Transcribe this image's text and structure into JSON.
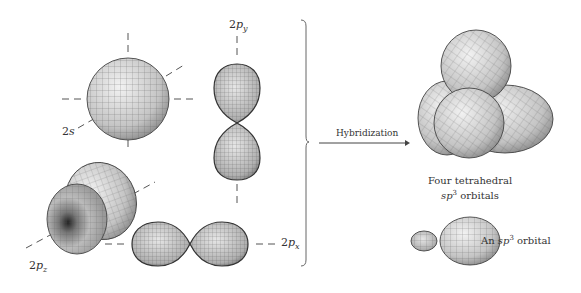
{
  "diagram": {
    "left_group": {
      "orbitals": [
        {
          "id": "2s",
          "label_main": "2",
          "label_italic": "s"
        },
        {
          "id": "2py",
          "label_main": "2",
          "label_italic": "p",
          "label_sub": "y"
        },
        {
          "id": "2pz",
          "label_main": "2",
          "label_italic": "p",
          "label_sub": "z"
        },
        {
          "id": "2px",
          "label_main": "2",
          "label_italic": "p",
          "label_sub": "x"
        }
      ]
    },
    "arrow": {
      "label": "Hybridization"
    },
    "right_group": {
      "tetrahedral_caption_line1": "Four tetrahedral",
      "tetrahedral_caption_line2_italic": "sp",
      "tetrahedral_caption_line2_sup": "3",
      "tetrahedral_caption_line2_rest": " orbitals",
      "single_caption_prefix": "An ",
      "single_caption_italic": "sp",
      "single_caption_sup": "3",
      "single_caption_rest": " orbital"
    },
    "colors": {
      "orbital_fill": "#c8c8c8",
      "grid_line": "#555555",
      "outline": "#333333",
      "axis_dash": "#555555",
      "text": "#333333"
    }
  }
}
